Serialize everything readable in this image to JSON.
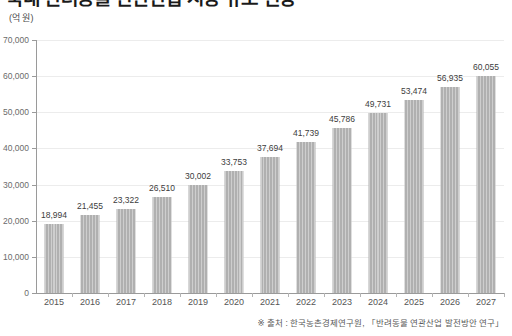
{
  "chart_data": {
    "type": "bar",
    "title": "국내 반려동물 연관산업 시장 규모 전망",
    "unit_label": "(억 원)",
    "xlabel": "",
    "ylabel": "",
    "categories": [
      "2015",
      "2016",
      "2017",
      "2018",
      "2019",
      "2020",
      "2021",
      "2022",
      "2023",
      "2024",
      "2025",
      "2026",
      "2027"
    ],
    "values": [
      18994,
      21455,
      23322,
      26510,
      30002,
      33753,
      37694,
      41739,
      45786,
      49731,
      53474,
      56935,
      60055
    ],
    "value_labels": [
      "18,994",
      "21,455",
      "23,322",
      "26,510",
      "30,002",
      "33,753",
      "37,694",
      "41,739",
      "45,786",
      "49,731",
      "53,474",
      "56,935",
      "60,055"
    ],
    "ylim": [
      0,
      70000
    ],
    "ytick_values": [
      0,
      10000,
      20000,
      30000,
      40000,
      50000,
      60000,
      70000
    ],
    "ytick_labels": [
      "0",
      "10,000",
      "20,000",
      "30,000",
      "40,000",
      "50,000",
      "60,000",
      "70,000"
    ],
    "grid": true,
    "legend": "none",
    "bar_color": "#b0b0b0",
    "gridline_color": "#ececec",
    "axis_color": "#9a9a9a",
    "label_color": "#3c3c3c"
  },
  "footnote": {
    "text": "※ 출처 : 한국농촌경제연구원, 「반려동물 연관산업 발전방안 연구」"
  }
}
